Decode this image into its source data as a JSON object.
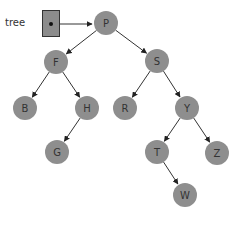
{
  "diagram": {
    "type": "binary-search-tree",
    "pointer": {
      "label": "tree",
      "target": "P"
    },
    "colors": {
      "node_fill": "#8e8e8e",
      "pointer_fill": "#8c8c8c",
      "edge": "#333333",
      "text": "#333333"
    },
    "nodes": [
      {
        "id": "P",
        "label": "P",
        "x": 106,
        "y": 23
      },
      {
        "id": "F",
        "label": "F",
        "x": 56,
        "y": 62
      },
      {
        "id": "S",
        "label": "S",
        "x": 157,
        "y": 61
      },
      {
        "id": "B",
        "label": "B",
        "x": 25,
        "y": 108
      },
      {
        "id": "H",
        "label": "H",
        "x": 87,
        "y": 108
      },
      {
        "id": "R",
        "label": "R",
        "x": 125,
        "y": 108
      },
      {
        "id": "Y",
        "label": "Y",
        "x": 187,
        "y": 108
      },
      {
        "id": "G",
        "label": "G",
        "x": 57,
        "y": 152
      },
      {
        "id": "T",
        "label": "T",
        "x": 157,
        "y": 152
      },
      {
        "id": "Z",
        "label": "Z",
        "x": 217,
        "y": 153
      },
      {
        "id": "W",
        "label": "W",
        "x": 185,
        "y": 195
      }
    ],
    "edges": [
      {
        "from": "P",
        "to": "F"
      },
      {
        "from": "P",
        "to": "S"
      },
      {
        "from": "F",
        "to": "B"
      },
      {
        "from": "F",
        "to": "H"
      },
      {
        "from": "H",
        "to": "G"
      },
      {
        "from": "S",
        "to": "R"
      },
      {
        "from": "S",
        "to": "Y"
      },
      {
        "from": "Y",
        "to": "T"
      },
      {
        "from": "Y",
        "to": "Z"
      },
      {
        "from": "T",
        "to": "W"
      }
    ]
  }
}
